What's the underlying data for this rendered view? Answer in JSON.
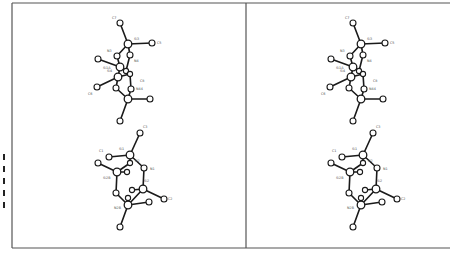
{
  "figure": {
    "type": "stereo-pair molecular structure (ORTEP-style ball-and-stick)",
    "panels": [
      "left-view",
      "right-view"
    ],
    "stereo_offset_x": 233
  },
  "labels": [
    {
      "text": "C7",
      "x": 112,
      "y": 19
    },
    {
      "text": "Si3",
      "x": 134,
      "y": 40
    },
    {
      "text": "C5",
      "x": 157,
      "y": 44
    },
    {
      "text": "N3",
      "x": 107,
      "y": 52
    },
    {
      "text": "N4",
      "x": 134,
      "y": 62
    },
    {
      "text": "Si1A",
      "x": 103,
      "y": 69
    },
    {
      "text": "Si4",
      "x": 107,
      "y": 72
    },
    {
      "text": "C8",
      "x": 140,
      "y": 82
    },
    {
      "text": "N44",
      "x": 136,
      "y": 90
    },
    {
      "text": "C6",
      "x": 88,
      "y": 95
    },
    {
      "text": "C3",
      "x": 143,
      "y": 128
    },
    {
      "text": "Si1",
      "x": 119,
      "y": 150
    },
    {
      "text": "C1",
      "x": 99,
      "y": 152
    },
    {
      "text": "N2",
      "x": 135,
      "y": 162
    },
    {
      "text": "N1",
      "x": 150,
      "y": 170
    },
    {
      "text": "Si2B",
      "x": 103,
      "y": 179
    },
    {
      "text": "Si2",
      "x": 144,
      "y": 182
    },
    {
      "text": "C2",
      "x": 168,
      "y": 200
    },
    {
      "text": "N2B",
      "x": 114,
      "y": 209
    }
  ],
  "atoms": [
    {
      "id": "C7",
      "x": 120,
      "y": 23,
      "r": 3
    },
    {
      "id": "Si3",
      "x": 128,
      "y": 44,
      "r": 3.8
    },
    {
      "id": "C5",
      "x": 152,
      "y": 43,
      "r": 3
    },
    {
      "id": "N3",
      "x": 117,
      "y": 56,
      "r": 3
    },
    {
      "id": "N4",
      "x": 130,
      "y": 55,
      "r": 3
    },
    {
      "id": "Cl",
      "x": 98,
      "y": 59,
      "r": 3
    },
    {
      "id": "Si4",
      "x": 120,
      "y": 67,
      "r": 3.8
    },
    {
      "id": "h1",
      "x": 126,
      "y": 71,
      "r": 2.6
    },
    {
      "id": "h2",
      "x": 130,
      "y": 74,
      "r": 2.6
    },
    {
      "id": "SiA",
      "x": 118,
      "y": 77,
      "r": 3.8
    },
    {
      "id": "C6",
      "x": 97,
      "y": 87,
      "r": 3
    },
    {
      "id": "n5",
      "x": 116,
      "y": 88,
      "r": 3
    },
    {
      "id": "N44",
      "x": 131,
      "y": 89,
      "r": 3
    },
    {
      "id": "Si5",
      "x": 128,
      "y": 99,
      "r": 3.8
    },
    {
      "id": "C9",
      "x": 150,
      "y": 99,
      "r": 3
    },
    {
      "id": "C10",
      "x": 120,
      "y": 121,
      "r": 3
    },
    {
      "id": "C3",
      "x": 140,
      "y": 133,
      "r": 3
    },
    {
      "id": "Si1",
      "x": 130,
      "y": 155,
      "r": 3.8
    },
    {
      "id": "C1",
      "x": 109,
      "y": 157,
      "r": 3
    },
    {
      "id": "Cx",
      "x": 98,
      "y": 163,
      "r": 3
    },
    {
      "id": "N2",
      "x": 130,
      "y": 163,
      "r": 2.6
    },
    {
      "id": "N1",
      "x": 144,
      "y": 168,
      "r": 3
    },
    {
      "id": "Si2B",
      "x": 117,
      "y": 172,
      "r": 3.8
    },
    {
      "id": "h3",
      "x": 127,
      "y": 172,
      "r": 2.6
    },
    {
      "id": "Si2",
      "x": 143,
      "y": 189,
      "r": 3.8
    },
    {
      "id": "h4",
      "x": 132,
      "y": 190,
      "r": 2.6
    },
    {
      "id": "C2",
      "x": 164,
      "y": 199,
      "r": 3
    },
    {
      "id": "n6",
      "x": 116,
      "y": 193,
      "r": 3
    },
    {
      "id": "h5",
      "x": 128,
      "y": 198,
      "r": 2.6
    },
    {
      "id": "N2B",
      "x": 128,
      "y": 205,
      "r": 3.8
    },
    {
      "id": "C11",
      "x": 149,
      "y": 202,
      "r": 3
    },
    {
      "id": "C12",
      "x": 120,
      "y": 227,
      "r": 3
    }
  ],
  "bonds": [
    [
      "C7",
      "Si3"
    ],
    [
      "Si3",
      "C5"
    ],
    [
      "Si3",
      "N3"
    ],
    [
      "Si3",
      "N4"
    ],
    [
      "N3",
      "Si4"
    ],
    [
      "N4",
      "h1"
    ],
    [
      "Cl",
      "Si4"
    ],
    [
      "Si4",
      "h1"
    ],
    [
      "Si4",
      "SiA"
    ],
    [
      "h1",
      "h2"
    ],
    [
      "SiA",
      "C6"
    ],
    [
      "SiA",
      "n5"
    ],
    [
      "SiA",
      "h2"
    ],
    [
      "h2",
      "N44"
    ],
    [
      "n5",
      "Si5"
    ],
    [
      "N44",
      "Si5"
    ],
    [
      "Si5",
      "C9"
    ],
    [
      "Si5",
      "C10"
    ],
    [
      "C3",
      "Si1"
    ],
    [
      "Si1",
      "C1"
    ],
    [
      "Si1",
      "N2"
    ],
    [
      "Si1",
      "N1"
    ],
    [
      "N2",
      "Si2B"
    ],
    [
      "Cx",
      "Si2B"
    ],
    [
      "Si2B",
      "h3"
    ],
    [
      "Si2B",
      "n6"
    ],
    [
      "N1",
      "Si2"
    ],
    [
      "Si2",
      "h4"
    ],
    [
      "Si2",
      "C2"
    ],
    [
      "Si2",
      "N2B"
    ],
    [
      "n6",
      "N2B"
    ],
    [
      "N2B",
      "h5"
    ],
    [
      "N2B",
      "C11"
    ],
    [
      "N2B",
      "C12"
    ]
  ],
  "frame": {
    "left": 12,
    "top": 3,
    "bottom": 248,
    "divider_x": 246,
    "right": 450
  },
  "margin_marks": [
    {
      "x": 3,
      "y": 154
    },
    {
      "x": 3,
      "y": 166
    },
    {
      "x": 3,
      "y": 178
    },
    {
      "x": 3,
      "y": 190
    },
    {
      "x": 3,
      "y": 202
    }
  ]
}
